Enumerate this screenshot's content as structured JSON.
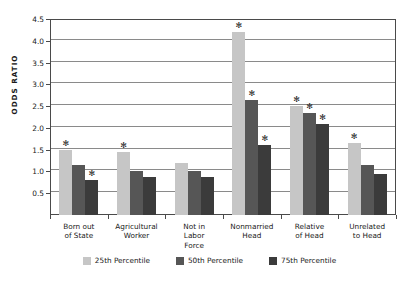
{
  "chart_data": {
    "type": "bar",
    "title": "",
    "xlabel": "",
    "ylabel": "ODDS RATIO",
    "ylim": [
      0,
      4.5
    ],
    "ytick_labels": [
      "0.5",
      "1.0",
      "1.5",
      "2.0",
      "2.5",
      "3.0",
      "3.5",
      "4.0",
      "4.5"
    ],
    "ytick_values": [
      0.5,
      1.0,
      1.5,
      2.0,
      2.5,
      3.0,
      3.5,
      4.0,
      4.5
    ],
    "grid": true,
    "legend_position": "bottom",
    "categories": [
      "Born out of State",
      "Agricultural Worker",
      "Not in Labor Force",
      "Nonmarried Head",
      "Relative of Head",
      "Unrelated to Head"
    ],
    "category_lines": [
      [
        "Born out",
        "of State"
      ],
      [
        "Agricultural",
        "Worker"
      ],
      [
        "Not in",
        "Labor",
        "Force"
      ],
      [
        "Nonmarried",
        "Head"
      ],
      [
        "Relative",
        "of Head"
      ],
      [
        "Unrelated",
        "to Head"
      ]
    ],
    "series": [
      {
        "name": "25th Percentile",
        "color": "#c6c6c6",
        "values": [
          1.5,
          1.45,
          1.2,
          4.2,
          2.5,
          1.65
        ],
        "significant": [
          true,
          true,
          false,
          true,
          true,
          true
        ]
      },
      {
        "name": "50th Percentile",
        "color": "#565656",
        "values": [
          1.15,
          1.02,
          1.0,
          2.65,
          2.35,
          1.15
        ],
        "significant": [
          false,
          false,
          false,
          true,
          true,
          false
        ]
      },
      {
        "name": "75th Percentile",
        "color": "#3b3b3b",
        "values": [
          0.8,
          0.87,
          0.87,
          1.6,
          2.1,
          0.95
        ],
        "significant": [
          true,
          false,
          false,
          true,
          true,
          false
        ]
      }
    ],
    "significance_marker": "✻"
  }
}
